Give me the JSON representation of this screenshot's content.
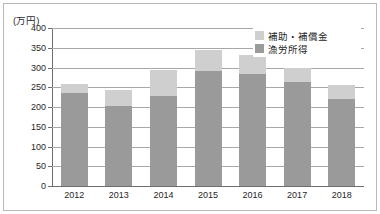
{
  "figure": {
    "unit_label": "(万円)"
  },
  "legend": {
    "position": "top-right",
    "items": [
      {
        "label": "補助・補償金",
        "color": "#cfcfcf",
        "swatch_name": "legend-swatch-subsidy"
      },
      {
        "label": "漁労所得",
        "color": "#9a9a9a",
        "swatch_name": "legend-swatch-income"
      }
    ]
  },
  "chart_data": {
    "type": "bar",
    "stacked": true,
    "title": "",
    "subtitle": "",
    "xlabel": "",
    "ylabel": "(万円)",
    "ylim": [
      0,
      400
    ],
    "ytick_step": 50,
    "grid": true,
    "legend_position": "top-right",
    "categories": [
      "2012",
      "2013",
      "2014",
      "2015",
      "2016",
      "2017",
      "2018"
    ],
    "ytick_labels": [
      "0",
      "50",
      "100",
      "150",
      "200",
      "250",
      "300",
      "350",
      "400"
    ],
    "ytick_values": [
      0,
      50,
      100,
      150,
      200,
      250,
      300,
      350,
      400
    ],
    "series": [
      {
        "name": "漁労所得",
        "color": "#9a9a9a",
        "values": [
          235,
          202,
          228,
          291,
          284,
          263,
          220
        ]
      },
      {
        "name": "補助・補償金",
        "color": "#cfcfcf",
        "values": [
          23,
          41,
          67,
          53,
          47,
          37,
          36
        ]
      }
    ],
    "totals": [
      258,
      243,
      295,
      344,
      331,
      300,
      256
    ]
  }
}
